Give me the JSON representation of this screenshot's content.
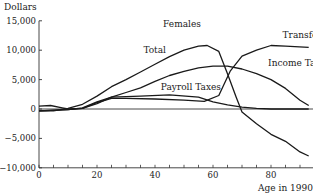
{
  "chart_data": {
    "type": "line",
    "title": "Females",
    "xlabel": "Age in 1990",
    "ylabel": "Dollars",
    "xlim": [
      0,
      95
    ],
    "ylim": [
      -10000,
      15000
    ],
    "grid": false,
    "legend_position": "inline labels",
    "x_ticks": [
      0,
      20,
      40,
      60,
      80
    ],
    "x_tick_labels": [
      "0",
      "20",
      "40",
      "60",
      "80"
    ],
    "y_ticks": [
      15000,
      10000,
      5000,
      0,
      -5000,
      -10000
    ],
    "y_tick_labels": [
      "15,000",
      "10,000",
      "5,000",
      "0",
      "−5,000",
      "−10,000"
    ],
    "series": [
      {
        "name": "Total",
        "x": [
          0,
          5,
          10,
          15,
          20,
          25,
          30,
          35,
          40,
          45,
          50,
          55,
          58,
          62,
          65,
          68,
          70,
          75,
          80,
          85,
          90,
          93
        ],
        "values": [
          -300,
          -300,
          100,
          800,
          2200,
          3800,
          5000,
          6300,
          7600,
          8900,
          10000,
          10700,
          10800,
          9800,
          6000,
          2000,
          -500,
          -2500,
          -4300,
          -5500,
          -7300,
          -8000
        ]
      },
      {
        "name": "Transfers",
        "x": [
          0,
          4,
          8,
          10,
          15,
          20,
          25,
          30,
          40,
          50,
          57,
          62,
          66,
          70,
          75,
          80,
          85,
          93
        ],
        "values": [
          500,
          600,
          200,
          0,
          100,
          1100,
          1800,
          1800,
          1700,
          1500,
          1300,
          2300,
          6500,
          9000,
          10000,
          10800,
          10700,
          10500
        ]
      },
      {
        "name": "Income Taxes",
        "x": [
          0,
          10,
          15,
          20,
          25,
          30,
          35,
          40,
          45,
          50,
          55,
          60,
          65,
          70,
          75,
          80,
          85,
          90,
          93
        ],
        "values": [
          -300,
          -100,
          100,
          900,
          2000,
          2800,
          3600,
          4700,
          5700,
          6400,
          7000,
          7300,
          7300,
          6800,
          6000,
          5000,
          3500,
          1500,
          600
        ]
      },
      {
        "name": "Payroll Taxes",
        "x": [
          0,
          10,
          15,
          20,
          25,
          35,
          45,
          55,
          60,
          65,
          70,
          75,
          80,
          93
        ],
        "values": [
          -300,
          -100,
          200,
          1200,
          2000,
          2200,
          2400,
          2000,
          1200,
          700,
          300,
          100,
          0,
          0
        ]
      }
    ],
    "annotations": [
      {
        "text": "Females",
        "x": 48,
        "y": 14000
      },
      {
        "text": "Total",
        "x": 36,
        "y": 9500
      },
      {
        "text": "Transfers",
        "x": 84,
        "y": 12000
      },
      {
        "text": "Income Taxes",
        "x": 79,
        "y": 7300
      },
      {
        "text": "Payroll Taxes",
        "x": 42,
        "y": 3200
      }
    ]
  }
}
